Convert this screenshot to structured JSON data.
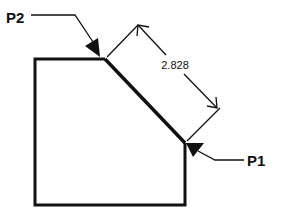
{
  "diagram": {
    "type": "chamfer-distance-dimension",
    "labels": {
      "p2": "P2",
      "p1": "P1"
    },
    "dimension": {
      "value": "2.828"
    },
    "colors": {
      "stroke": "#111111",
      "background": "#ffffff"
    }
  }
}
